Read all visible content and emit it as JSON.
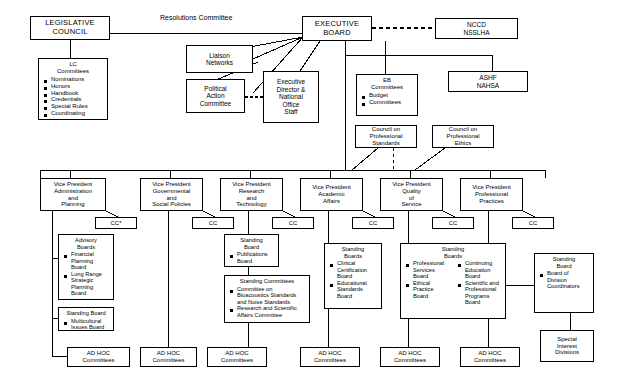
{
  "chart_title": "ASHA Organizational Structure",
  "edge_labels": {
    "resolutions": "Resolutions Committee"
  },
  "nodes": {
    "legislative_council": {
      "title": "LEGISLATIVE\nCOUNCIL"
    },
    "lc_committees": {
      "header": "LC\nCommittees",
      "items": [
        "Nominations",
        "Honors",
        "Handbook",
        "Credentials",
        "Special Rules",
        "Coordinating"
      ]
    },
    "liaison_networks": {
      "title": "Liaison\nNetworks"
    },
    "political_action_committee": {
      "title": "Political\nAction\nCommittee"
    },
    "executive_director": {
      "title": "Executive\nDirector &\nNational\nOffice\nStaff"
    },
    "executive_board": {
      "title": "EXECUTIVE\nBOARD"
    },
    "nccd_nsslha": {
      "title": "NCCD\nNSSLHA"
    },
    "ashf_nahsa": {
      "title": "ASHF\nNAHSA"
    },
    "eb_committees": {
      "header": "EB\nCommittees",
      "items": [
        "Budget",
        "Committees"
      ]
    },
    "council_professional_standards": {
      "title": "Council on\nProfessional\nStandards"
    },
    "council_professional_ethics": {
      "title": "Council on\nProfessional\nEthics"
    },
    "vp_administration": {
      "title": "Vice President\nAdministration\nand\nPlanning"
    },
    "vp_governmental": {
      "title": "Vice President\nGovernmental\nand\nSocial Policies"
    },
    "vp_research": {
      "title": "Vice President\nResearch\nand\nTechnology"
    },
    "vp_academic": {
      "title": "Vice President\nAcademic\nAffairs"
    },
    "vp_quality": {
      "title": "Vice President\nQuality\nof\nService"
    },
    "vp_professional": {
      "title": "Vice President\nProfessional\nPractices"
    },
    "cc_1": {
      "title": "CC*"
    },
    "cc_2": {
      "title": "CC"
    },
    "cc_3": {
      "title": "CC"
    },
    "cc_4": {
      "title": "CC"
    },
    "cc_5": {
      "title": "CC"
    },
    "cc_6": {
      "title": "CC"
    },
    "advisory_boards": {
      "header": "Advisory\nBoards",
      "items": [
        "Financial\nPlanning\nBoard",
        "Long Range\nStrategic\nPlanning\nBoard"
      ]
    },
    "standing_board_multicultural": {
      "header": "Standing Board",
      "items": [
        "Multicultural\nIssues Board"
      ]
    },
    "standing_board_publications": {
      "header": "Standing\nBoard",
      "items": [
        "Publications\nBoard"
      ]
    },
    "standing_committees_research": {
      "header": "Standing Committees",
      "items": [
        "Committee on\nBioacoustics Standards\nand Noise Standards",
        "Research and Scientific\nAffairs Committee"
      ]
    },
    "standing_boards_academic": {
      "header": "Standing\nBoards",
      "items": [
        "Clinical\nCertification\nBoard",
        "Educational\nStandards\nBoard"
      ]
    },
    "standing_boards_quality": {
      "header": "Standing\nBoards",
      "items_left": [
        "Professional\nServices\nBoard",
        "Ethical\nPractice\nBoard"
      ],
      "items_right": [
        "Continuing\nEducation\nBoard",
        "Scientific and\nProfessional\nPrograms\nBoard"
      ]
    },
    "standing_board_division": {
      "header": "Standing\nBoard",
      "items": [
        "Board of\nDivision\nCoordinators"
      ]
    },
    "special_interest_divisions": {
      "title": "Special\nInterest\nDivisions"
    },
    "ad_hoc_1": {
      "title": "AD HOC\nCommittees"
    },
    "ad_hoc_2": {
      "title": "AD HOC\nCommittees"
    },
    "ad_hoc_3": {
      "title": "AD HOC\nCommittees"
    },
    "ad_hoc_4": {
      "title": "AD HOC\nCommittees"
    },
    "ad_hoc_5": {
      "title": "AD HOC\nCommittees"
    },
    "ad_hoc_6": {
      "title": "AD HOC\nCommittees"
    }
  }
}
